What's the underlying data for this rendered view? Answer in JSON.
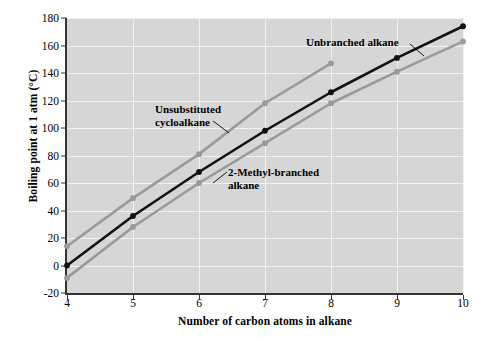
{
  "chart_data": {
    "type": "line",
    "title": "",
    "xlabel": "Number of carbon atoms in alkane",
    "ylabel": "Boiling point at 1 atm (°C)",
    "xlim": [
      4,
      10
    ],
    "ylim": [
      -20,
      180
    ],
    "xticks": [
      4,
      5,
      6,
      7,
      8,
      9,
      10
    ],
    "yticks": [
      -20,
      0,
      20,
      40,
      60,
      80,
      100,
      120,
      140,
      160,
      180
    ],
    "grid": true,
    "legend": "annotations-inline",
    "plot_background": "#d6d6d6",
    "gridline_color": "#f2f2f2",
    "series": [
      {
        "name": "Unbranched alkane",
        "color": "#111111",
        "marker": "circle",
        "x": [
          4,
          5,
          6,
          7,
          8,
          9,
          10
        ],
        "values": [
          0,
          36,
          68,
          98,
          126,
          151,
          174
        ]
      },
      {
        "name": "Unsubstituted cycloalkane",
        "color": "#9a9a9a",
        "marker": "circle",
        "x": [
          4,
          5,
          6,
          7,
          8
        ],
        "values": [
          14,
          49,
          81,
          118,
          147
        ]
      },
      {
        "name": "2-Methyl-branched alkane",
        "color": "#9a9a9a",
        "marker": "circle",
        "x": [
          4,
          5,
          6,
          7,
          8,
          9,
          10
        ],
        "values": [
          -9,
          28,
          60,
          89,
          118,
          141,
          163
        ]
      }
    ],
    "annotations": [
      {
        "id": "unbranched",
        "text": "Unbranched alkane"
      },
      {
        "id": "cycloalkane",
        "text": "Unsubstituted\ncycloalkane"
      },
      {
        "id": "methyl",
        "text": "2-Methyl-branched\nalkane"
      }
    ]
  },
  "axes": {
    "y_title": "Boiling point at 1 atm (°C)",
    "x_title": "Number of carbon atoms in alkane",
    "ytick_labels": [
      "-20",
      "0",
      "20",
      "40",
      "60",
      "80",
      "100",
      "120",
      "140",
      "160",
      "180"
    ],
    "xtick_labels": [
      "4",
      "5",
      "6",
      "7",
      "8",
      "9",
      "10"
    ]
  },
  "annotations": {
    "unbranched": "Unbranched alkane",
    "cycloalkane_line1": "Unsubstituted",
    "cycloalkane_line2": "cycloalkane",
    "methyl_line1": "2-Methyl-branched",
    "methyl_line2": "alkane"
  }
}
